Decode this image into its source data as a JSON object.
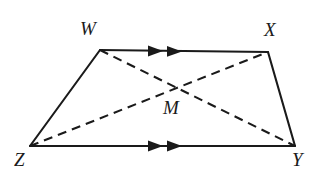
{
  "figure": {
    "name": "Trapezoid WXYZ with diagonals meeting at M",
    "canvas": {
      "width": 323,
      "height": 180
    },
    "background_color": "#ffffff",
    "stroke_color": "#1a1a1a"
  },
  "vertices": [
    {
      "id": "W",
      "label": "W",
      "x": 100,
      "y": 50,
      "label_x": 80,
      "label_y": 19
    },
    {
      "id": "X",
      "label": "X",
      "x": 268,
      "y": 52,
      "label_x": 264,
      "label_y": 20
    },
    {
      "id": "Y",
      "label": "Y",
      "x": 295,
      "y": 146,
      "label_x": 292,
      "label_y": 150
    },
    {
      "id": "Z",
      "label": "Z",
      "x": 30,
      "y": 146,
      "label_x": 14,
      "label_y": 150
    },
    {
      "id": "M",
      "label": "M",
      "x": 172,
      "y": 88,
      "label_x": 163,
      "label_y": 98
    }
  ],
  "edges": [
    {
      "id": "WX",
      "from": "W",
      "to": "X",
      "style": "solid",
      "tick_marks": 2,
      "tick_direction": "right"
    },
    {
      "id": "ZY",
      "from": "Z",
      "to": "Y",
      "style": "solid",
      "tick_marks": 2,
      "tick_direction": "right"
    },
    {
      "id": "WZ",
      "from": "W",
      "to": "Z",
      "style": "solid",
      "tick_marks": 0,
      "tick_direction": ""
    },
    {
      "id": "XY",
      "from": "X",
      "to": "Y",
      "style": "solid",
      "tick_marks": 0,
      "tick_direction": ""
    },
    {
      "id": "WY",
      "from": "W",
      "to": "Y",
      "style": "dashed",
      "tick_marks": 0,
      "tick_direction": ""
    },
    {
      "id": "ZX",
      "from": "Z",
      "to": "X",
      "style": "dashed",
      "tick_marks": 0,
      "tick_direction": ""
    }
  ],
  "labels": {
    "W": "W",
    "X": "X",
    "Y": "Y",
    "Z": "Z",
    "M": "M"
  }
}
